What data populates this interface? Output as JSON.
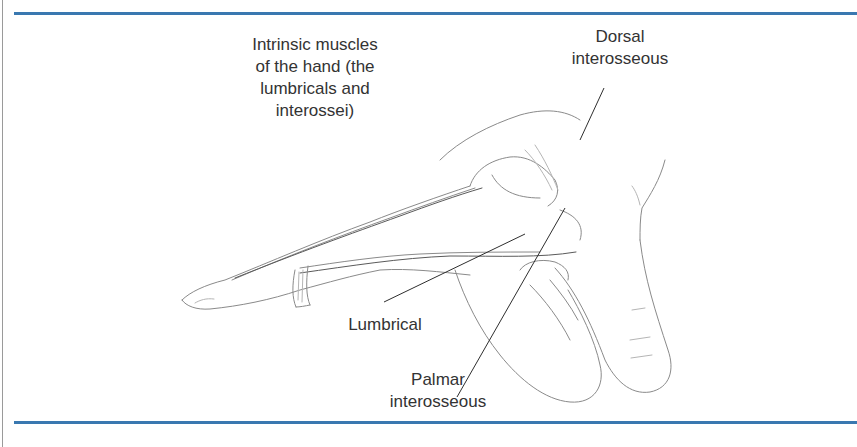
{
  "figure": {
    "rule_color": "#3a78b0",
    "labels": {
      "intrinsic": {
        "lines": [
          "Intrinsic muscles",
          "of the hand (the",
          "lumbricals and",
          "interossei)"
        ]
      },
      "dorsal": {
        "lines": [
          "Dorsal",
          "interosseous"
        ]
      },
      "lumbrical": {
        "lines": [
          "Lumbrical"
        ]
      },
      "palmar": {
        "lines": [
          "Palmar",
          "interosseous"
        ]
      }
    }
  }
}
